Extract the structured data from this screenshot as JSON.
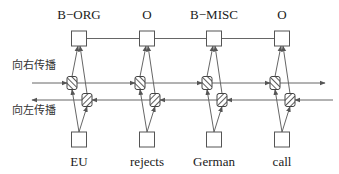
{
  "diagram": {
    "type": "bidirectional-rnn-sequence-labeling",
    "outputs": [
      "B−ORG",
      "O",
      "B−MISC",
      "O"
    ],
    "inputs": [
      "EU",
      "rejects",
      "German",
      "call"
    ],
    "forward_label": "向右传播",
    "backward_label": "向左传播",
    "colors": {
      "line": "#666666",
      "box_stroke": "#555555",
      "hatch": "#333333",
      "text": "#1a1a1a"
    }
  }
}
